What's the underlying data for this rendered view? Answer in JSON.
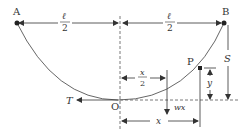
{
  "diagram": {
    "points": {
      "A": "A",
      "B": "B",
      "O": "O",
      "P": "P"
    },
    "labels": {
      "tension": "T",
      "half_span_left_num": "ℓ",
      "half_span_left_den": "2",
      "half_span_right_num": "ℓ",
      "half_span_right_den": "2",
      "half_x_num": "x",
      "half_x_den": "2",
      "x": "x",
      "wx": "wx",
      "y": "y",
      "S": "S"
    },
    "colors": {
      "line": "#333333",
      "background": "#ffffff"
    }
  }
}
